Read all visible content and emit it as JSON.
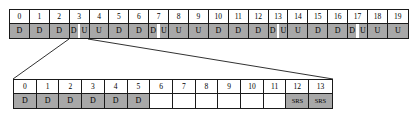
{
  "diagram": {
    "colors": {
      "fill_gray": "#a8a8a8",
      "fill_empty": "#ffffff",
      "border": "#1a1a1a",
      "connector": "#1a1a1a"
    }
  },
  "top_table": {
    "name": "radio-frame",
    "cell_count": 20,
    "indices": [
      "0",
      "1",
      "2",
      "3",
      "4",
      "5",
      "6",
      "7",
      "8",
      "9",
      "10",
      "11",
      "12",
      "13",
      "14",
      "15",
      "16",
      "17",
      "18",
      "19"
    ],
    "cells": [
      {
        "type": "single",
        "label": "D"
      },
      {
        "type": "single",
        "label": "D"
      },
      {
        "type": "single",
        "label": "D"
      },
      {
        "type": "split",
        "label_a": "D",
        "label_b": "U"
      },
      {
        "type": "single",
        "label": "U"
      },
      {
        "type": "single",
        "label": "D"
      },
      {
        "type": "single",
        "label": "D"
      },
      {
        "type": "split",
        "label_a": "D",
        "label_b": "U"
      },
      {
        "type": "single",
        "label": "U"
      },
      {
        "type": "single",
        "label": "U"
      },
      {
        "type": "single",
        "label": "D"
      },
      {
        "type": "single",
        "label": "D"
      },
      {
        "type": "single",
        "label": "D"
      },
      {
        "type": "split",
        "label_a": "D",
        "label_b": "U"
      },
      {
        "type": "single",
        "label": "U"
      },
      {
        "type": "single",
        "label": "D"
      },
      {
        "type": "single",
        "label": "D"
      },
      {
        "type": "split",
        "label_a": "D",
        "label_b": "U"
      },
      {
        "type": "single",
        "label": "U"
      },
      {
        "type": "single",
        "label": "U"
      }
    ]
  },
  "bottom_table": {
    "name": "expanded-subframe",
    "cell_count": 14,
    "indices": [
      "0",
      "1",
      "2",
      "3",
      "4",
      "5",
      "6",
      "7",
      "8",
      "9",
      "10",
      "11",
      "12",
      "13"
    ],
    "cells": [
      {
        "type": "single",
        "label": "D"
      },
      {
        "type": "single",
        "label": "D"
      },
      {
        "type": "single",
        "label": "D"
      },
      {
        "type": "single",
        "label": "D"
      },
      {
        "type": "single",
        "label": "D"
      },
      {
        "type": "single",
        "label": "D"
      },
      {
        "type": "empty",
        "label": ""
      },
      {
        "type": "empty",
        "label": ""
      },
      {
        "type": "empty",
        "label": ""
      },
      {
        "type": "empty",
        "label": ""
      },
      {
        "type": "empty",
        "label": ""
      },
      {
        "type": "empty",
        "label": ""
      },
      {
        "type": "single",
        "label": "SRS"
      },
      {
        "type": "single",
        "label": "SRS"
      }
    ]
  },
  "callout": {
    "name": "expansion-callout",
    "source_cell_index": "3",
    "left_line": {
      "x1": 69,
      "y1": 39,
      "x2": 13,
      "y2": 79
    },
    "right_line": {
      "x1": 88,
      "y1": 39,
      "x2": 333,
      "y2": 79
    }
  }
}
